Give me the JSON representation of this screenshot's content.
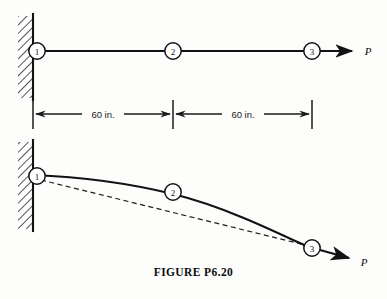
{
  "figure": {
    "caption": "FIGURE P6.20",
    "colors": {
      "ink": "#121212",
      "background": "#fdfdfc",
      "hatch": "#2a2a2a",
      "dashed": "#1d1d1d"
    }
  },
  "undeformed": {
    "label": "undeformed-configuration",
    "nodes": [
      {
        "id": "1",
        "label": "1",
        "x": 37,
        "y": 51
      },
      {
        "id": "2",
        "label": "2",
        "x": 173,
        "y": 51
      },
      {
        "id": "3",
        "label": "3",
        "x": 312,
        "y": 51
      }
    ],
    "beam": {
      "x1": 37,
      "y1": 51,
      "x2": 312,
      "y2": 51
    },
    "load": {
      "label": "P",
      "label_x": 368,
      "label_y": 51,
      "arrow_from_x": 320,
      "arrow_from_y": 51,
      "arrow_to_x": 355,
      "arrow_to_y": 51
    },
    "support": {
      "type": "fixed-wall-hatched",
      "line_x": 33,
      "top_y": 16,
      "bottom_y": 98
    }
  },
  "dimensions": {
    "label": "dimension-line",
    "baseline_y": 114,
    "ticks": [
      33,
      173,
      312
    ],
    "tick_top_y": 100,
    "tick_bottom_y": 129,
    "spans": [
      {
        "text": "60 in.",
        "from_x": 33,
        "to_x": 173,
        "text_x": 103,
        "text_y": 114
      },
      {
        "text": "60 in.",
        "from_x": 173,
        "to_x": 312,
        "text_x": 243,
        "text_y": 114
      }
    ]
  },
  "deformed": {
    "label": "deformed-configuration",
    "nodes": [
      {
        "id": "1",
        "label": "1",
        "x": 37,
        "y": 176
      },
      {
        "id": "2",
        "label": "2",
        "x": 173,
        "y": 192
      },
      {
        "id": "3",
        "label": "3",
        "x": 312,
        "y": 248
      }
    ],
    "curve_path": "M 33 175 C 85 177 128 183 173 194 C 222 206 272 230 306 246",
    "chord_dashed": {
      "x1": 41,
      "y1": 180,
      "x2": 305,
      "y2": 245
    },
    "load": {
      "label": "P",
      "label_x": 364,
      "label_y": 262,
      "arrow_from_x": 320,
      "arrow_from_y": 250,
      "arrow_to_x": 352,
      "arrow_to_y": 259
    },
    "support": {
      "type": "fixed-wall-hatched",
      "line_x": 33,
      "top_y": 142,
      "bottom_y": 229
    }
  }
}
